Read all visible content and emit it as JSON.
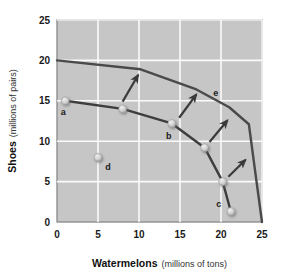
{
  "chart_data": {
    "type": "line",
    "title": "",
    "xlabel_bold": "Watermelons",
    "xlabel_light": "(millions of tons)",
    "ylabel_bold": "Shoes",
    "ylabel_light": "(millions of pairs)",
    "xlim": [
      0,
      25
    ],
    "ylim": [
      0,
      25
    ],
    "xticks": [
      0,
      5,
      10,
      15,
      20,
      25
    ],
    "yticks": [
      0,
      5,
      10,
      15,
      20,
      25
    ],
    "xtick_labels": [
      "0",
      "5",
      "10",
      "15",
      "20",
      "25"
    ],
    "ytick_labels": [
      "0",
      "5",
      "10",
      "15",
      "20",
      "25"
    ],
    "grid": true,
    "grid_color": "#ffffff",
    "plot_bg": "#c6c6c6",
    "legend": "none",
    "series": [
      {
        "name": "outer-frontier",
        "kind": "line",
        "color": "#4a4a4a",
        "points": [
          {
            "x": 0,
            "y": 20.0
          },
          {
            "x": 10.2,
            "y": 18.9
          },
          {
            "x": 17.0,
            "y": 16.4
          },
          {
            "x": 21.0,
            "y": 14.2
          },
          {
            "x": 23.4,
            "y": 12.1
          },
          {
            "x": 24.2,
            "y": 6.0
          },
          {
            "x": 25.0,
            "y": 0.0
          }
        ]
      },
      {
        "name": "inner-frontier",
        "kind": "line-with-markers",
        "color": "#3d3d3d",
        "points": [
          {
            "x": 1.0,
            "y": 15.0,
            "label": "a"
          },
          {
            "x": 8.0,
            "y": 14.0,
            "label": ""
          },
          {
            "x": 14.0,
            "y": 12.2,
            "label": "b"
          },
          {
            "x": 18.0,
            "y": 9.2,
            "label": ""
          },
          {
            "x": 20.2,
            "y": 5.0,
            "label": ""
          },
          {
            "x": 21.2,
            "y": 1.3,
            "label": "c"
          }
        ]
      }
    ],
    "isolated_points": [
      {
        "x": 5.0,
        "y": 8.0,
        "label": "d",
        "name": "point-d"
      }
    ],
    "point_labels": [
      {
        "label": "a",
        "x": 1.0,
        "y": 15.0,
        "dx": -2,
        "dy": 14
      },
      {
        "label": "b",
        "x": 14.0,
        "y": 12.2,
        "dx": -3,
        "dy": 16
      },
      {
        "label": "c",
        "x": 21.2,
        "y": 1.3,
        "dx": -12,
        "dy": -4
      },
      {
        "label": "d",
        "x": 5.0,
        "y": 8.0,
        "dx": 10,
        "dy": 13
      },
      {
        "label": "e",
        "x": 19.0,
        "y": 15.6,
        "dx": 3,
        "dy": 0
      }
    ],
    "arrows": [
      {
        "name": "arrow-1",
        "x1": 8.0,
        "y1": 14.9,
        "x2": 9.9,
        "y2": 18.2
      },
      {
        "name": "arrow-2",
        "x1": 14.9,
        "y1": 12.9,
        "x2": 17.0,
        "y2": 15.8
      },
      {
        "name": "arrow-3",
        "x1": 18.6,
        "y1": 9.9,
        "x2": 20.8,
        "y2": 12.6
      },
      {
        "name": "arrow-4",
        "x1": 20.9,
        "y1": 5.6,
        "x2": 23.0,
        "y2": 7.7
      }
    ],
    "annotations": {
      "a": "attainable and efficient point on inner frontier",
      "b": "attainable and efficient point on inner frontier",
      "c": "attainable and efficient point on inner frontier",
      "d": "attainable but inefficient point",
      "e": "outer frontier label"
    }
  }
}
